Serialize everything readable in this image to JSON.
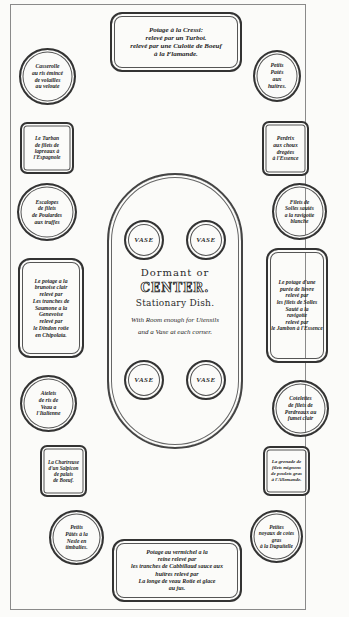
{
  "diagram": {
    "type": "table-setting-plan",
    "top_dish": {
      "lines": [
        "Potage à la Cressi:",
        "relevé par un Turbot.",
        "relevé par une Culotte de Boeuf",
        "à la Flamande."
      ]
    },
    "bottom_dish": {
      "lines": [
        "Potage au vermichel a la",
        "reine relevé par",
        "les tranches de Cabbillaud sauce aux",
        "huitres relevé par",
        "La longe de veau Rotie et glace",
        "au jus."
      ]
    },
    "left_column": [
      {
        "shape": "round",
        "lines": [
          "Casserolle",
          "au ris émincé",
          "de volailles",
          "au veloute"
        ]
      },
      {
        "shape": "rect",
        "lines": [
          "Le Turban",
          "de filets de",
          "lapreaux à",
          "l'Espagnole"
        ]
      },
      {
        "shape": "round",
        "lines": [
          "Escalopes",
          "de filets",
          "de Poulardes",
          "aux truffes"
        ]
      },
      {
        "shape": "cartouche",
        "lines": [
          "Le potage a la",
          "brunoise clair",
          "relevé par",
          "Les tranches de",
          "Saumone a la",
          "Genevoise",
          "relevé par",
          "le Dindon rotie",
          "en Chipolata."
        ]
      },
      {
        "shape": "round",
        "lines": [
          "Atelets",
          "de ris de",
          "Veau a",
          "l'Italienne"
        ]
      },
      {
        "shape": "rect",
        "lines": [
          "La Chartreuse",
          "d'un Salpicon",
          "de palais",
          "de Boeuf."
        ]
      },
      {
        "shape": "round",
        "lines": [
          "Petits",
          "Pâtés à la",
          "Nesle en",
          "timbalies."
        ]
      }
    ],
    "right_column": [
      {
        "shape": "round",
        "lines": [
          "Petits",
          "Patés",
          "aux",
          "huitres."
        ]
      },
      {
        "shape": "rect",
        "lines": [
          "Perdrix",
          "aux choux",
          "dregées",
          "à l'Essence"
        ]
      },
      {
        "shape": "round",
        "lines": [
          "Filets de",
          "Solles sautés",
          "a la ravigotte",
          "blanche"
        ]
      },
      {
        "shape": "cartouche",
        "lines": [
          "Le potage d'une",
          "purée de lievre",
          "relevé par",
          "les filets de Solles",
          "Sauté a la",
          "ravigotte",
          "relevé par",
          "le Jambon à l'Essence",
          "a l'Essence"
        ]
      },
      {
        "shape": "round",
        "lines": [
          "Cotelettes",
          "de filets de",
          "Perdreaux au",
          "fumet clair"
        ]
      },
      {
        "shape": "rect",
        "lines": [
          "La grenade de",
          "filets mignons",
          "de poulets gras",
          "à l'Allemande."
        ]
      },
      {
        "shape": "round",
        "lines": [
          "Petites",
          "noyaux de cotes",
          "gras",
          "à la Dupuitelle"
        ]
      }
    ],
    "centerpiece": {
      "vases": [
        "VASE",
        "VASE",
        "VASE",
        "VASE"
      ],
      "title_line1": "Dormant or",
      "title_line2": "CENTER.",
      "title_line3": "Stationary Dish.",
      "note_line1": "With Room enough for Utensils",
      "note_line2": "and a Vase at each corner."
    }
  }
}
